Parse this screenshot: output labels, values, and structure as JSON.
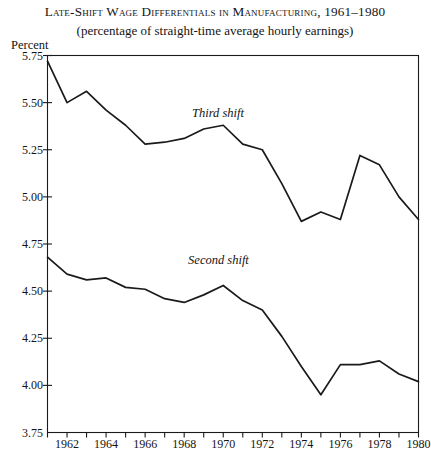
{
  "title": "Late-Shift Wage Differentials in Manufacturing, 1961–1980",
  "subtitle": "(percentage of straight-time average hourly earnings)",
  "axis_unit_label": "Percent",
  "colors": {
    "line": "#1a1a1a",
    "axis": "#1a1a1a",
    "background": "#ffffff",
    "text": "#141414"
  },
  "chart_data": {
    "type": "line",
    "title": "Late-Shift Wage Differentials in Manufacturing, 1961–1980",
    "subtitle": "(percentage of straight-time average hourly earnings)",
    "xlabel": "",
    "ylabel": "Percent",
    "xlim": [
      1961,
      1980
    ],
    "ylim": [
      3.75,
      5.75
    ],
    "ytick_values": [
      3.75,
      4.0,
      4.25,
      4.5,
      4.75,
      5.0,
      5.25,
      5.5,
      5.75
    ],
    "ytick_labels": [
      "3.75",
      "4.00",
      "4.25",
      "4.50",
      "4.75",
      "5.00",
      "5.25",
      "5.50",
      "5.75"
    ],
    "xtick_values": [
      1961,
      1962,
      1963,
      1964,
      1965,
      1966,
      1967,
      1968,
      1969,
      1970,
      1971,
      1972,
      1973,
      1974,
      1975,
      1976,
      1977,
      1978,
      1979,
      1980
    ],
    "xtick_labels_shown": [
      "1962",
      "1964",
      "1966",
      "1968",
      "1970",
      "1972",
      "1974",
      "1976",
      "1978",
      "1980"
    ],
    "grid": false,
    "legend": "inline-annotations",
    "x": [
      1961,
      1962,
      1963,
      1964,
      1965,
      1966,
      1967,
      1968,
      1969,
      1970,
      1971,
      1972,
      1973,
      1974,
      1975,
      1976,
      1977,
      1978,
      1979,
      1980
    ],
    "series": [
      {
        "name": "Third shift",
        "label": "Third shift",
        "label_x": 1968.4,
        "label_y": 5.44,
        "values": [
          5.72,
          5.5,
          5.56,
          5.46,
          5.38,
          5.28,
          5.29,
          5.31,
          5.36,
          5.38,
          5.28,
          5.25,
          5.07,
          4.87,
          4.92,
          4.88,
          5.22,
          5.17,
          5.0,
          4.88
        ]
      },
      {
        "name": "Second shift",
        "label": "Second shift",
        "label_x": 1968.2,
        "label_y": 4.66,
        "values": [
          4.68,
          4.59,
          4.56,
          4.57,
          4.52,
          4.51,
          4.46,
          4.44,
          4.48,
          4.53,
          4.45,
          4.4,
          4.26,
          4.1,
          3.95,
          4.11,
          4.11,
          4.13,
          4.06,
          4.02
        ]
      }
    ]
  },
  "annotations": [
    {
      "name": "third-shift-label",
      "text": "Third shift"
    },
    {
      "name": "second-shift-label",
      "text": "Second shift"
    }
  ]
}
